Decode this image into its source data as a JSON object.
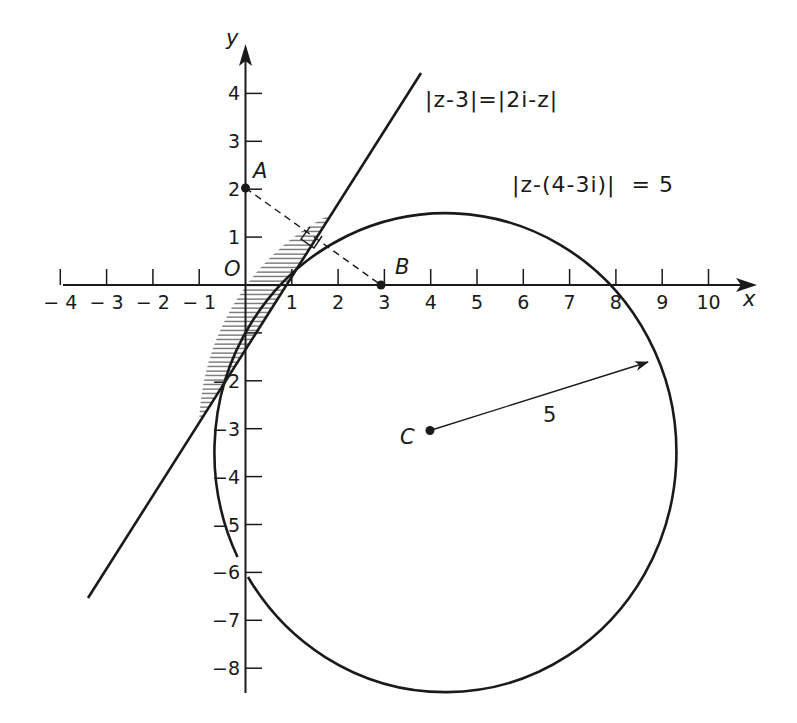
{
  "figure": {
    "axes": {
      "x_label": "x",
      "y_label": "y",
      "origin_label": "O",
      "x_ticks": [
        {
          "v": -4,
          "label": "-4"
        },
        {
          "v": -3,
          "label": "-3"
        },
        {
          "v": -2,
          "label": "-2"
        },
        {
          "v": -1,
          "label": "-1"
        },
        {
          "v": 1,
          "label": "1"
        },
        {
          "v": 2,
          "label": "2"
        },
        {
          "v": 3,
          "label": "3"
        },
        {
          "v": 4,
          "label": "4"
        },
        {
          "v": 5,
          "label": "5"
        },
        {
          "v": 6,
          "label": "6"
        },
        {
          "v": 7,
          "label": "7"
        },
        {
          "v": 8,
          "label": "8"
        },
        {
          "v": 9,
          "label": "9"
        },
        {
          "v": 10,
          "label": "10"
        }
      ],
      "y_ticks": [
        {
          "v": 4,
          "label": "4"
        },
        {
          "v": 3,
          "label": "3"
        },
        {
          "v": 2,
          "label": "2"
        },
        {
          "v": 1,
          "label": "1"
        },
        {
          "v": -1,
          "label": ""
        },
        {
          "v": -2,
          "label": "-2"
        },
        {
          "v": -3,
          "label": "-3"
        },
        {
          "v": -4,
          "label": "-4"
        },
        {
          "v": -5,
          "label": "-5"
        },
        {
          "v": -6,
          "label": "-6"
        },
        {
          "v": -7,
          "label": "-7"
        },
        {
          "v": -8,
          "label": "-8"
        }
      ],
      "x_range": [
        -4,
        10
      ],
      "y_range": [
        -8,
        4
      ]
    },
    "points": [
      {
        "name": "A",
        "label": "A",
        "x": 0,
        "y": 2
      },
      {
        "name": "B",
        "label": "B",
        "x": 3,
        "y": 0
      },
      {
        "name": "C",
        "label": "C",
        "x": 4,
        "y": -3
      }
    ],
    "line": {
      "equation_label": "|z-3|=|2i-z|",
      "cartesian": "y = 1.5x - 1.25",
      "description": "perpendicular bisector of A(0,2) and B(3,0)"
    },
    "circle": {
      "equation_label": "|z-(4-3i)|  = 5",
      "center": [
        4,
        -3
      ],
      "radius": 5,
      "radius_label": "5"
    },
    "shaded_region": "region inside circle and on the upper-left side of the line (lens between intersections)",
    "right_angle_marker": "where segment AB meets the line"
  }
}
